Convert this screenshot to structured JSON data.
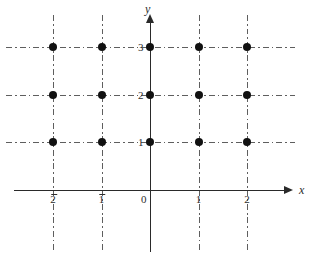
{
  "figure": {
    "type": "coordinate-grid-diagram",
    "width": 313,
    "height": 254,
    "background_color": "#ffffff"
  },
  "axes": {
    "x_axis": {
      "label": "x",
      "color": "#2a2a2a",
      "arrow": "right",
      "arrow_icon_name": "x-axis-arrow-icon"
    },
    "y_axis": {
      "label": "y",
      "color": "#2a2a2a",
      "arrow": "up",
      "arrow_icon_name": "y-axis-arrow-icon"
    },
    "origin_label": "0"
  },
  "ticks": {
    "x": [
      {
        "value": -2,
        "label": "2",
        "negative": true,
        "px": 53
      },
      {
        "value": -1,
        "label": "1",
        "negative": true,
        "px": 101.5
      },
      {
        "value": 0,
        "label": "0",
        "negative": false,
        "px": 150
      },
      {
        "value": 1,
        "label": "1",
        "negative": false,
        "px": 198.5
      },
      {
        "value": 2,
        "label": "2",
        "negative": false,
        "px": 247
      }
    ],
    "y": [
      {
        "value": 1,
        "label": "1",
        "px": 142
      },
      {
        "value": 2,
        "label": "2",
        "px": 95
      },
      {
        "value": 3,
        "label": "3",
        "px": 47
      }
    ]
  },
  "gridlines": {
    "style": "dash-dot",
    "color": "#5e5e5e",
    "horizontal_y_values": [
      1,
      2,
      3
    ],
    "vertical_x_values": [
      -2,
      -1,
      1,
      2
    ]
  },
  "chart_data": {
    "type": "scatter",
    "title": "",
    "xlabel": "x",
    "ylabel": "y",
    "xlim": [
      -2.8,
      2.8
    ],
    "ylim": [
      -1.3,
      3.8
    ],
    "grid": true,
    "legend": null,
    "xtick_labels": [
      "-2",
      "-1",
      "0",
      "1",
      "2"
    ],
    "ytick_labels": [
      "1",
      "2",
      "3"
    ],
    "marker": "filled-circle",
    "marker_color": "#111111",
    "points": [
      {
        "x": -2,
        "y": 3
      },
      {
        "x": -1,
        "y": 3
      },
      {
        "x": 0,
        "y": 3
      },
      {
        "x": 1,
        "y": 3
      },
      {
        "x": 2,
        "y": 3
      },
      {
        "x": -2,
        "y": 2
      },
      {
        "x": -1,
        "y": 2
      },
      {
        "x": 0,
        "y": 2
      },
      {
        "x": 1,
        "y": 2
      },
      {
        "x": 2,
        "y": 2
      },
      {
        "x": -2,
        "y": 1
      },
      {
        "x": -1,
        "y": 1
      },
      {
        "x": 0,
        "y": 1
      },
      {
        "x": 1,
        "y": 1
      },
      {
        "x": 2,
        "y": 1
      }
    ],
    "point_count": 15
  }
}
